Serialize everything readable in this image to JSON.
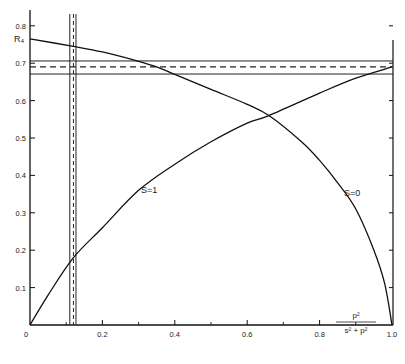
{
  "chart_data": {
    "type": "line",
    "title": "",
    "xlabel_num": "p²",
    "xlabel_den": "s² + p²",
    "ylabel": "R₄",
    "xlim": [
      0,
      1.0
    ],
    "ylim": [
      0,
      0.85
    ],
    "grid": false,
    "x_ticks": [
      0,
      0.2,
      0.4,
      0.6,
      0.8,
      1.0
    ],
    "x_tick_labels": [
      "0",
      "0.2",
      "0.4",
      "0.6",
      "0.8",
      "1.0"
    ],
    "x_minor_ticks": [
      0.1,
      0.3,
      0.5,
      0.7,
      0.9
    ],
    "y_ticks": [
      0.1,
      0.2,
      0.3,
      0.4,
      0.5,
      0.6,
      0.7,
      0.8
    ],
    "y_tick_labels": [
      "0.1",
      "0.2",
      "0.3",
      "0.4",
      "0.5",
      "0.6",
      "0.7",
      "0.8"
    ],
    "series": [
      {
        "name": "S=1",
        "label": "S=1",
        "x": [
          0,
          0.05,
          0.12,
          0.2,
          0.3,
          0.4,
          0.5,
          0.6,
          0.66,
          0.8,
          0.9,
          1.0
        ],
        "values": [
          0,
          0.08,
          0.18,
          0.26,
          0.36,
          0.43,
          0.49,
          0.54,
          0.56,
          0.62,
          0.66,
          0.69
        ]
      },
      {
        "name": "S=0",
        "label": "S=0",
        "x": [
          0,
          0.12,
          0.2,
          0.3,
          0.35,
          0.4,
          0.5,
          0.6,
          0.66,
          0.75,
          0.8,
          0.85,
          0.9,
          0.95,
          0.98,
          1.0
        ],
        "values": [
          0.765,
          0.745,
          0.73,
          0.705,
          0.69,
          0.67,
          0.63,
          0.59,
          0.56,
          0.49,
          0.44,
          0.38,
          0.31,
          0.2,
          0.11,
          0
        ]
      }
    ],
    "annotations": {
      "horizontal_band": {
        "center": 0.69,
        "lower": 0.671,
        "upper": 0.706,
        "center_style": "dashed"
      },
      "vertical_band": {
        "center": 0.12,
        "lower": 0.11,
        "upper": 0.127,
        "center_style": "dashed"
      }
    },
    "legend": "inline curve labels"
  }
}
